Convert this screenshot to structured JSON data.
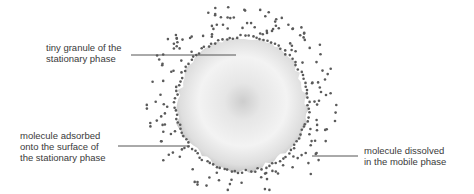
{
  "diagram": {
    "colors": {
      "text": "#3a3a3a",
      "leader": "#555555",
      "dot": "#5a5a5a",
      "granule_center": "#cfcfcf",
      "granule_mid": "#f2f2f2",
      "granule_edge": "#c4c4c4"
    },
    "labels": {
      "granule": {
        "lines": [
          "tiny granule of the",
          "stationary phase"
        ]
      },
      "adsorbed": {
        "lines": [
          "molecule adsorbed",
          "onto the surface of",
          "the stationary phase"
        ]
      },
      "dissolved": {
        "lines": [
          "molecule dissolved",
          "in the mobile phase"
        ]
      }
    }
  }
}
